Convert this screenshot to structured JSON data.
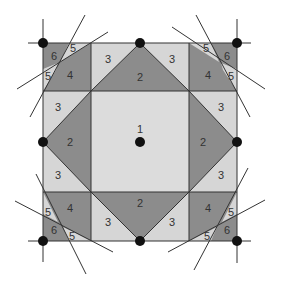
{
  "diagram": {
    "colors": {
      "light": "#d6d6d6",
      "center": "#dcdcdc",
      "dark": "#8c8c8c",
      "stroke": "#333333",
      "node": "#111111"
    },
    "labels": {
      "center": "1",
      "triangle_big": "2",
      "triangle_small": "3",
      "corner_quad": "4",
      "corner_sliver": "5",
      "corner_tip": "6"
    }
  }
}
